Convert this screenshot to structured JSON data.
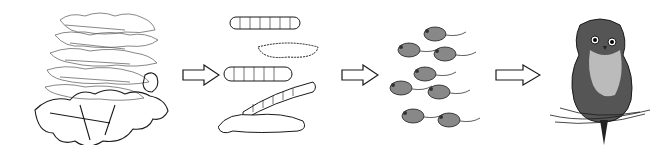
{
  "diagram": {
    "type": "food-chain",
    "nodes": [
      {
        "id": "leaves",
        "label": "Leaves"
      },
      {
        "id": "caterpillars",
        "label": "Caterpillars"
      },
      {
        "id": "mice",
        "label": "Mice"
      },
      {
        "id": "owl",
        "label": "Owl"
      }
    ],
    "edges": [
      {
        "from": "leaves",
        "to": "caterpillars"
      },
      {
        "from": "caterpillars",
        "to": "mice"
      },
      {
        "from": "mice",
        "to": "owl"
      }
    ],
    "colors": {
      "ink": "#1a1a1a",
      "background": "#ffffff"
    }
  }
}
